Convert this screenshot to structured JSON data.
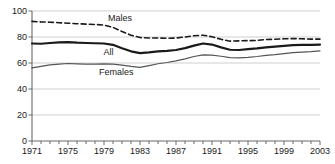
{
  "chart_data": {
    "type": "line",
    "title": "",
    "subtitle": "",
    "xlabel": "",
    "ylabel": "",
    "xlim": [
      1971,
      2003
    ],
    "ylim": [
      0,
      100
    ],
    "grid": true,
    "grid_axis": "y",
    "legend_position": "inline-labels",
    "ytick_values": [
      0,
      20,
      40,
      60,
      80,
      100
    ],
    "ytick_labels": [
      "0",
      "20",
      "40",
      "60",
      "80",
      "100"
    ],
    "xtick_labels": [
      "1971",
      "1975",
      "1979",
      "1983",
      "1987",
      "1991",
      "1995",
      "1999",
      "2003"
    ],
    "xtick_values": [
      1971,
      1975,
      1979,
      1983,
      1987,
      1991,
      1995,
      1999,
      2003
    ],
    "x_minor_ticks_every": 1,
    "x": [
      1971,
      1972,
      1973,
      1974,
      1975,
      1976,
      1977,
      1978,
      1979,
      1980,
      1981,
      1982,
      1983,
      1984,
      1985,
      1986,
      1987,
      1988,
      1989,
      1990,
      1991,
      1992,
      1993,
      1994,
      1995,
      1996,
      1997,
      1998,
      1999,
      2000,
      2001,
      2002,
      2003
    ],
    "series": [
      {
        "name": "Males",
        "style": "dashed",
        "color": "#1a1a1a",
        "width": 1.6,
        "label_text": "Males",
        "values": [
          92.0,
          91.6,
          91.4,
          91.0,
          90.6,
          90.2,
          89.9,
          89.6,
          89.2,
          87.4,
          84.2,
          81.4,
          79.6,
          79.2,
          79.2,
          79.0,
          79.2,
          80.0,
          81.0,
          81.4,
          80.2,
          78.2,
          76.8,
          77.0,
          77.2,
          77.4,
          78.0,
          78.3,
          78.6,
          78.8,
          78.6,
          78.4,
          78.4
        ]
      },
      {
        "name": "All",
        "style": "solid",
        "color": "#1a1a1a",
        "width": 2.2,
        "label_text": "All",
        "values": [
          75.0,
          74.8,
          75.4,
          75.8,
          76.0,
          75.6,
          75.4,
          75.2,
          75.0,
          74.0,
          71.4,
          69.0,
          67.6,
          68.2,
          69.0,
          69.4,
          70.0,
          71.4,
          73.4,
          75.0,
          74.2,
          72.0,
          70.2,
          70.0,
          70.6,
          71.2,
          72.0,
          72.6,
          73.2,
          73.8,
          74.0,
          74.0,
          74.2
        ]
      },
      {
        "name": "Females",
        "style": "thin",
        "color": "#555555",
        "width": 1.2,
        "label_text": "Females",
        "values": [
          56.2,
          57.4,
          58.6,
          59.2,
          59.6,
          59.4,
          59.2,
          59.2,
          59.4,
          59.2,
          58.4,
          57.4,
          56.6,
          58.0,
          59.4,
          60.4,
          61.6,
          63.2,
          65.0,
          66.2,
          66.0,
          65.2,
          64.2,
          64.0,
          64.4,
          65.0,
          65.8,
          66.4,
          67.2,
          68.0,
          68.4,
          68.8,
          69.4
        ]
      }
    ],
    "annotations": [
      {
        "text": "Males",
        "x": 1981.0,
        "y": 94.0
      },
      {
        "text": "All",
        "x": 1980.5,
        "y": 67.5
      },
      {
        "text": "Females",
        "x": 1980.0,
        "y": 52.0
      }
    ]
  }
}
